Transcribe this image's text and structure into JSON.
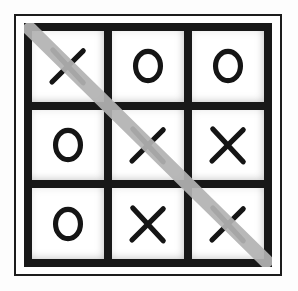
{
  "image": {
    "title": "Tic-Tac-Toe Board",
    "description": "Completed tic-tac-toe game with a diagonal winning line",
    "background_color": "#fdfdfd"
  },
  "board": {
    "rows": 3,
    "columns": 3,
    "grid_color": "#181818",
    "cell_color": "#ffffff",
    "mark_color": "#151515",
    "cells": [
      {
        "row": 0,
        "col": 0,
        "position": "top-left",
        "mark": "X",
        "on_win_line": true
      },
      {
        "row": 0,
        "col": 1,
        "position": "top-center",
        "mark": "O",
        "on_win_line": false
      },
      {
        "row": 0,
        "col": 2,
        "position": "top-right",
        "mark": "O",
        "on_win_line": false
      },
      {
        "row": 1,
        "col": 0,
        "position": "middle-left",
        "mark": "O",
        "on_win_line": false
      },
      {
        "row": 1,
        "col": 1,
        "position": "center",
        "mark": "X",
        "on_win_line": true
      },
      {
        "row": 1,
        "col": 2,
        "position": "middle-right",
        "mark": "X",
        "on_win_line": false
      },
      {
        "row": 2,
        "col": 0,
        "position": "bottom-left",
        "mark": "O",
        "on_win_line": false
      },
      {
        "row": 2,
        "col": 1,
        "position": "bottom-center",
        "mark": "X",
        "on_win_line": false
      },
      {
        "row": 2,
        "col": 2,
        "position": "bottom-right",
        "mark": "X",
        "on_win_line": true
      }
    ]
  },
  "win_line": {
    "type": "diagonal",
    "direction": "top-left-to-bottom-right",
    "winner": "X",
    "color": "#b3b3b3",
    "thickness_px": 14,
    "start": {
      "x": 6,
      "y": 6
    },
    "end": {
      "x": 242,
      "y": 238
    }
  },
  "frame": {
    "outer_border_color": "#1c1c1c",
    "outer_border_width_px": 2
  }
}
